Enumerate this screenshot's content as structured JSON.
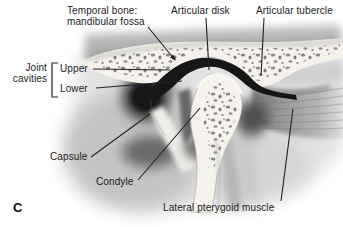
{
  "figure": {
    "panel_letter": "C",
    "type": "anatomical-diagram",
    "labels": {
      "temporal_bone_line1": "Temporal bone:",
      "temporal_bone_line2": "mandibular fossa",
      "articular_disk": "Articular disk",
      "articular_tubercle": "Articular tubercle",
      "joint_cavities_line1": "Joint",
      "joint_cavities_line2": "cavities",
      "joint_cavity_upper": "Upper",
      "joint_cavity_lower": "Lower",
      "capsule": "Capsule",
      "condyle": "Condyle",
      "lateral_pterygoid_muscle": "Lateral pterygoid muscle"
    },
    "colors": {
      "background": "#ffffff",
      "label_text": "#1b1b1b",
      "leader_line": "#222222",
      "articular_disk_fill": "#161616",
      "bone_fill": "#f4f2ea",
      "muscle_gray": "#8f8f8f"
    }
  }
}
